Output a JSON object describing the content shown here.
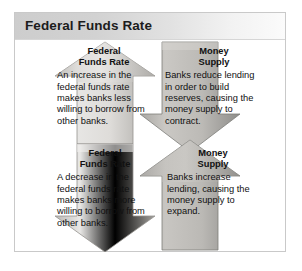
{
  "figure": {
    "title": "Federal Funds Rate",
    "colors": {
      "arrow_fill_light": "#e8e7e5",
      "arrow_fill_mid": "#cfcdc9",
      "arrow_fill_dark": "#9b9a97",
      "arrow_edge": "#8a8986",
      "title_text": "#1c1c1c",
      "body_text": "#111111",
      "frame_border": "#c9c9c9"
    },
    "cells": [
      {
        "id": "top-left",
        "arrow_direction": "up",
        "heading_line1": "Federal",
        "heading_line2": "Funds Rate",
        "body": "An increase in the federal funds rate makes banks less willing to borrow from other banks."
      },
      {
        "id": "top-right",
        "arrow_direction": "down",
        "heading_line1": "Money",
        "heading_line2": "Supply",
        "body": "Banks reduce lending in order to build reserves, causing the money supply to contract."
      },
      {
        "id": "bottom-left",
        "arrow_direction": "down",
        "heading_line1": "Federal",
        "heading_line2": "Funds Rate",
        "body": "A decrease in the federal funds rate makes banks more willing to borrow from other banks."
      },
      {
        "id": "bottom-right",
        "arrow_direction": "up",
        "heading_line1": "Money",
        "heading_line2": "Supply",
        "body": "Banks increase lending, causing the money supply to expand."
      }
    ]
  }
}
